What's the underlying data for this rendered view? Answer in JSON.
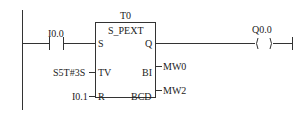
{
  "diagram": {
    "type": "ladder-logic",
    "timer": {
      "name": "T0",
      "function": "S_PEXT",
      "pins": {
        "start": "S",
        "time_value": "TV",
        "reset": "R",
        "output": "Q",
        "binary": "BI",
        "bcd": "BCD"
      }
    },
    "contact": {
      "address": "I0.0"
    },
    "time_value": "S5T#3S",
    "reset_input": "I0.1",
    "bi_output": "MW0",
    "bcd_output": "MW2",
    "coil": {
      "address": "Q0.0",
      "symbol": "( )"
    }
  }
}
